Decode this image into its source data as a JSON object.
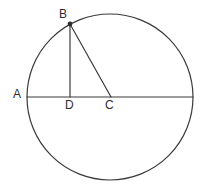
{
  "figure": {
    "type": "geometry-diagram",
    "canvas": {
      "width": 204,
      "height": 188,
      "background": "#ffffff"
    },
    "stroke_color": "#3a3a3a",
    "stroke_width": 1.2,
    "circle": {
      "name": "main-circle",
      "center": {
        "x": 110,
        "y": 97
      },
      "radius": 83
    },
    "points": [
      {
        "id": "A",
        "label": "A",
        "x": 27,
        "y": 97,
        "marker": false
      },
      {
        "id": "B",
        "label": "B",
        "x": 70,
        "y": 24,
        "marker": true
      },
      {
        "id": "C",
        "label": "C",
        "x": 111,
        "y": 97,
        "marker": false
      },
      {
        "id": "D",
        "label": "D",
        "x": 70,
        "y": 97,
        "marker": false
      }
    ],
    "segments": [
      {
        "id": "AC-diameter",
        "from": "A",
        "to": "E",
        "x1": 27,
        "y1": 97,
        "x2": 193,
        "y2": 97
      },
      {
        "id": "BD-altitude",
        "from": "B",
        "to": "D",
        "x1": 70,
        "y1": 24,
        "x2": 70,
        "y2": 97
      },
      {
        "id": "BC-radius",
        "from": "B",
        "to": "C",
        "x1": 70,
        "y1": 24,
        "x2": 111,
        "y2": 97
      }
    ],
    "labels": {
      "A": "A",
      "B": "B",
      "C": "C",
      "D": "D"
    }
  }
}
